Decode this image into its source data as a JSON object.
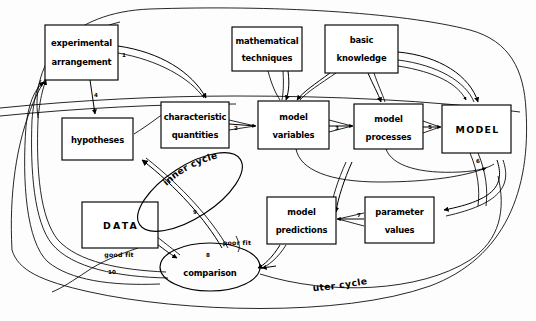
{
  "diagram": {
    "type": "flowchart",
    "background_color": "#fdfdfd",
    "stroke_color": "#000000",
    "nodes": [
      {
        "id": "experimental-arrangement",
        "shape": "rect",
        "line1": "experimental",
        "line2": "arrangement"
      },
      {
        "id": "mathematical-techniques",
        "shape": "rect",
        "line1": "mathematical",
        "line2": "techniques"
      },
      {
        "id": "basic-knowledge",
        "shape": "rect",
        "line1": "basic",
        "line2": "knowledge"
      },
      {
        "id": "hypotheses",
        "shape": "rect",
        "line1": "hypotheses",
        "line2": ""
      },
      {
        "id": "characteristic-quantities",
        "shape": "rect",
        "line1": "characteristic",
        "line2": "quantities"
      },
      {
        "id": "model-variables",
        "shape": "rect",
        "line1": "model",
        "line2": "variables"
      },
      {
        "id": "model-processes",
        "shape": "rect",
        "line1": "model",
        "line2": "processes"
      },
      {
        "id": "model",
        "shape": "rect",
        "line1": "MODEL",
        "line2": ""
      },
      {
        "id": "data",
        "shape": "rect",
        "line1": "DATA",
        "line2": ""
      },
      {
        "id": "model-predictions",
        "shape": "rect",
        "line1": "model",
        "line2": "predictions"
      },
      {
        "id": "parameter-values",
        "shape": "rect",
        "line1": "parameter",
        "line2": "values"
      },
      {
        "id": "comparison",
        "shape": "ellipse",
        "line1": "comparison",
        "line2": ""
      }
    ],
    "edge_numbers": [
      {
        "id": "edge-1",
        "label": "1"
      },
      {
        "id": "edge-2",
        "label": "2"
      },
      {
        "id": "edge-3",
        "label": "3"
      },
      {
        "id": "edge-4",
        "label": "4"
      },
      {
        "id": "edge-5",
        "label": "5"
      },
      {
        "id": "edge-6",
        "label": "6"
      },
      {
        "id": "edge-7",
        "label": "7"
      },
      {
        "id": "edge-8",
        "label": "8"
      },
      {
        "id": "edge-9",
        "label": "9"
      },
      {
        "id": "edge-10",
        "label": "10"
      }
    ],
    "edge_labels": [
      {
        "id": "good-fit",
        "label": "good fit"
      },
      {
        "id": "poor-fit",
        "label": "poor fit"
      }
    ],
    "cycle_labels": [
      {
        "id": "inner-cycle",
        "label": "inner cycle"
      },
      {
        "id": "outer-cycle",
        "label": "outer cycle"
      }
    ]
  }
}
